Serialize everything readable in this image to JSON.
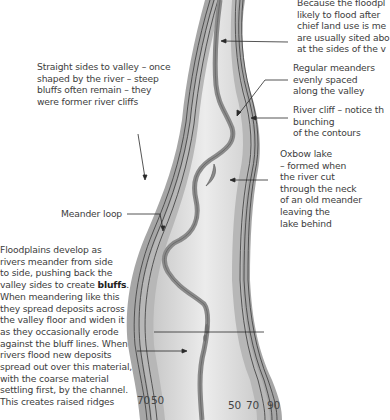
{
  "diagram": {
    "colors": {
      "valley_side_outer": "#a3a3a3",
      "valley_side_inner": "#b5b5b5",
      "floodplain_light": "#e6e6e6",
      "floodplain_mid": "#cfcfcf",
      "river": "#8a8a8a",
      "contour_line": "#3a3a3a",
      "leader_line": "#2a2a2a"
    },
    "annotations": {
      "top_right": [
        "Because the floodpl",
        "likely to flood after",
        "chief land use is me",
        "are usually sited abo",
        "at the sides of the v"
      ],
      "regular_meanders": [
        "Regular meanders",
        "evenly spaced",
        "along the valley"
      ],
      "river_cliff": [
        "River cliff – notice th",
        "bunching",
        "of the contours"
      ],
      "oxbow_lake": [
        "Oxbow lake",
        "– formed when",
        "the river cut",
        "through the neck",
        "of an old meander",
        "leaving the",
        "lake behind"
      ],
      "straight_sides": [
        "Straight sides to valley – once",
        "shaped by the river – steep",
        "bluffs often remain – they",
        "were former river cliffs"
      ],
      "meander_loop": "Meander loop",
      "floodplains": {
        "lines_before_bold": [
          "Floodplains develop as",
          "rivers meander from side",
          "to side, pushing back the"
        ],
        "line_with_bold_prefix": "valley sides to create ",
        "bold_word": "bluffs",
        "line_with_bold_suffix": ".",
        "lines_after_bold": [
          "When meandering like this",
          "they spread deposits across",
          "the valley floor and widen it",
          "as they occasionally erode",
          "against the bluff lines. When",
          "rivers flood new deposits",
          "spread out over this material,",
          "with the coarse material",
          "settling first, by the channel.",
          "This creates raised ridges"
        ]
      }
    },
    "contour_labels": {
      "left": [
        "70",
        "50"
      ],
      "right": [
        "50",
        "70",
        "90"
      ]
    }
  }
}
